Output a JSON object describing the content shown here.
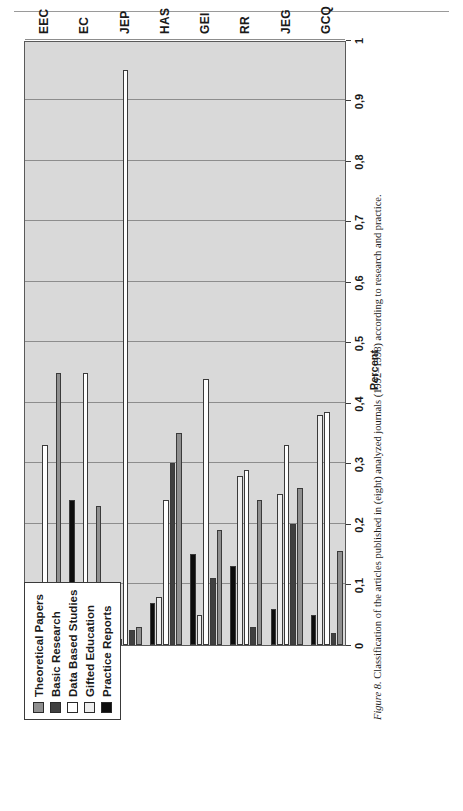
{
  "page": {
    "running_head": ""
  },
  "caption": {
    "figure_label": "Figure 8.",
    "text": " Classification of the articles published in (eight) analyzed journals (1992–1998) according to research and practice."
  },
  "legend": {
    "position": "top-left",
    "items": [
      {
        "label": "Theoretical Papers",
        "color": "#8f8f8f"
      },
      {
        "label": "Basic Research",
        "color": "#404040"
      },
      {
        "label": "Data Based Studies",
        "color": "#ffffff"
      },
      {
        "label": "Gifted Education",
        "color": "#ededed"
      },
      {
        "label": "Practice Reports",
        "color": "#0d0d0d"
      }
    ]
  },
  "chart_data": {
    "type": "bar",
    "orientation": "horizontal-rotated",
    "title": "",
    "xlabel": "",
    "ylabel": "Percent",
    "axis_title": "Percent",
    "ylim": [
      0,
      1
    ],
    "tick_values": [
      0,
      0.1,
      0.2,
      0.3,
      0.4,
      0.5,
      0.6,
      0.7,
      0.8,
      0.9,
      1
    ],
    "tick_labels": [
      "0",
      "0,1",
      "0,2",
      "0,3",
      "0,4",
      "0,5",
      "0,6",
      "0,7",
      "0,8",
      "0,9",
      "1"
    ],
    "grid": true,
    "categories": [
      "GCQ",
      "JEG",
      "RR",
      "GEI",
      "HAS",
      "JEP",
      "EC",
      "EEC"
    ],
    "series": [
      {
        "name": "Theoretical Papers",
        "color": "#8f8f8f",
        "values": [
          0.155,
          0.26,
          0.24,
          0.19,
          0.35,
          0.03,
          0.23,
          0.45
        ]
      },
      {
        "name": "Basic Research",
        "color": "#404040",
        "values": [
          0.02,
          0.2,
          0.03,
          0.11,
          0.3,
          0.025,
          0.0,
          0.025
        ]
      },
      {
        "name": "Data Based Studies",
        "color": "#ffffff",
        "values": [
          0.385,
          0.33,
          0.29,
          0.44,
          0.24,
          0.95,
          0.45,
          0.33
        ]
      },
      {
        "name": "Gifted Education",
        "color": "#ededed",
        "values": [
          0.38,
          0.25,
          0.28,
          0.05,
          0.08,
          0.01,
          0.01,
          0.055
        ]
      },
      {
        "name": "Practice Reports",
        "color": "#0d0d0d",
        "values": [
          0.05,
          0.06,
          0.13,
          0.15,
          0.07,
          0.0,
          0.24,
          0.022
        ]
      }
    ]
  }
}
